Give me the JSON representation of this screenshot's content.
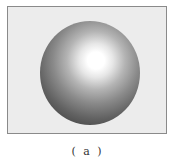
{
  "figure": {
    "caption": "( a )",
    "frame_color": "#ececec",
    "frame_border_color": "#8a8a8a",
    "sphere": {
      "highlight_color": "#ffffff",
      "shadow_color": "#333333"
    }
  }
}
